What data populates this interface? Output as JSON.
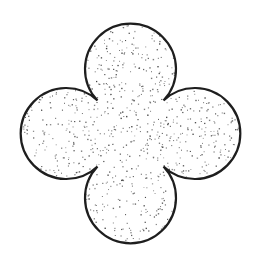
{
  "figure": {
    "alt": "Quatrefoil shape with stippled fill",
    "shape": "quatrefoil",
    "width": 257,
    "height": 261,
    "center": [
      130.5,
      133.5
    ],
    "lobe_radius": 45.5,
    "lobe_offset": 66,
    "colors": {
      "background": "#ffffff",
      "stroke": "#1e1e1e",
      "fill": "#ffffff",
      "stipple": "#5a5a5a"
    },
    "stroke_width": 2.2,
    "stipple": {
      "density": 1400,
      "dot_size": 1.1,
      "seed": 7
    }
  }
}
